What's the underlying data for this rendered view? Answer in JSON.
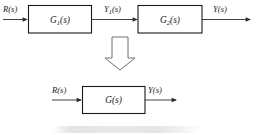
{
  "figure": {
    "type": "block-diagram",
    "topic": "cascade-block-reduction",
    "background_color": "#ffffff",
    "line_color": "#2b2b2b",
    "box_stroke_color": "#1a1a1a",
    "hollow_arrow_stroke": "#6e6e6e"
  },
  "top_diagram": {
    "input_label": "R(s)",
    "blocks": [
      {
        "label_main": "G",
        "label_sub": "1",
        "label_tail": "(s)",
        "label_full": "G1(s)"
      },
      {
        "label_main": "G",
        "label_sub": "2",
        "label_tail": "(s)",
        "label_full": "G2(s)"
      }
    ],
    "intermediate_label_main": "Y",
    "intermediate_label_sub": "1",
    "intermediate_label_tail": "(s)",
    "intermediate_label_full": "Y1(s)",
    "output_label": "Y(s)"
  },
  "transition": {
    "icon": "hollow-down-arrow"
  },
  "bottom_diagram": {
    "input_label": "R(s)",
    "block": {
      "label_main": "G",
      "label_tail": "(s)",
      "label_full": "G(s)"
    },
    "output_label": "Y(s)"
  }
}
